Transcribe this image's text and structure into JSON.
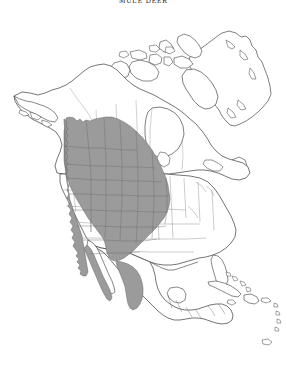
{
  "figure": {
    "title": "MULE DEER",
    "type": "species-range-map",
    "region": "North America",
    "background_color": "#ffffff"
  },
  "legend": {
    "range_fill_color": "#9b9b9b",
    "range_outline_color": "#6a6a6a",
    "coastline_color": "#3a3a3a",
    "internal_border_color": "#8c8c8c",
    "range_description": "Shaded area indicates species distribution"
  },
  "range_extent": {
    "north": "Southeast Alaska panhandle, central British Columbia and Alberta",
    "east": "Western Great Plains: Dakotas, Nebraska, Kansas, Oklahoma, west Texas",
    "south": "Baja California peninsula and Sierra Madre Occidental of northern Mexico",
    "west": "Pacific coast from Alaska panhandle to Baja California"
  },
  "landmasses": [
    "Alaska",
    "Canada",
    "Greenland",
    "Canadian Arctic Archipelago",
    "United States",
    "Mexico",
    "Central America",
    "Cuba",
    "Hispaniola",
    "Caribbean islands"
  ]
}
